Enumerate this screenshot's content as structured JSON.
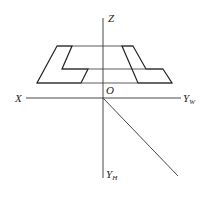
{
  "diagram": {
    "axes": {
      "z_label": "Z",
      "x_label": "X",
      "origin_label": "O",
      "yw_label": "Y",
      "yw_sub": "W",
      "yh_label": "Y",
      "yh_sub": "H"
    },
    "shapes": [
      {
        "name": "left-L-shape",
        "points": "57,46 72,46 62,69 88,69 81,83 37,83"
      },
      {
        "name": "right-L-shape",
        "points": "122,46 133,46 146,69 163,69 172,83 138,83"
      }
    ],
    "colors": {
      "line": "#222222",
      "background": "#ffffff"
    }
  }
}
